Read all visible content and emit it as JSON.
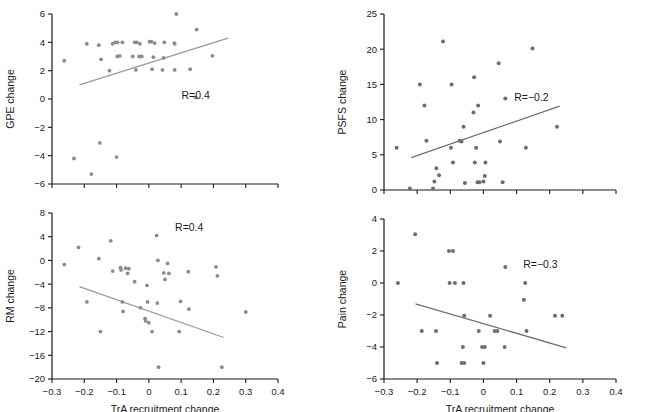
{
  "figure": {
    "xlabel": "TrA recruitment change",
    "panels": [
      "gpe",
      "psfs",
      "rm",
      "pain"
    ]
  },
  "chart_data": [
    {
      "id": "gpe",
      "type": "scatter",
      "title": "",
      "xlabel": "",
      "ylabel": "GPE change",
      "xlim": [
        -0.3,
        0.4
      ],
      "ylim": [
        -6,
        6
      ],
      "xticks": [
        -0.3,
        -0.2,
        -0.1,
        0,
        0.1,
        0.2,
        0.3,
        0.4
      ],
      "xticklabels": [
        "−0.3",
        "−0.2",
        "−0.1",
        "0",
        "0.1",
        "0.2",
        "0.3",
        "0.4"
      ],
      "yticks": [
        -6,
        -4,
        -2,
        0,
        2,
        4,
        6
      ],
      "yticklabels": [
        "−6",
        "−4",
        "−2",
        "0",
        "2",
        "4",
        "6"
      ],
      "grid": false,
      "legend": null,
      "annotation": "R=0.4",
      "annotation_xy": [
        0.145,
        0.0
      ],
      "marker_color": "#8c8c8c",
      "line_color": "#9a9a9a",
      "trendline": {
        "x": [
          -0.215,
          0.245
        ],
        "y": [
          1.0,
          4.3
        ]
      },
      "points": [
        {
          "x": -0.262,
          "y": 2.7
        },
        {
          "x": -0.232,
          "y": -4.2
        },
        {
          "x": -0.192,
          "y": 3.9
        },
        {
          "x": -0.178,
          "y": -5.3
        },
        {
          "x": -0.155,
          "y": 3.8
        },
        {
          "x": -0.148,
          "y": 2.8
        },
        {
          "x": -0.152,
          "y": -3.1
        },
        {
          "x": -0.122,
          "y": 2.0
        },
        {
          "x": -0.112,
          "y": 3.9
        },
        {
          "x": -0.104,
          "y": 4.0
        },
        {
          "x": -0.097,
          "y": 4.0
        },
        {
          "x": -0.098,
          "y": 3.0
        },
        {
          "x": -0.09,
          "y": 3.05
        },
        {
          "x": -0.082,
          "y": 4.0
        },
        {
          "x": -0.1,
          "y": -4.1
        },
        {
          "x": -0.05,
          "y": 3.0
        },
        {
          "x": -0.044,
          "y": 4.0
        },
        {
          "x": -0.038,
          "y": 4.0
        },
        {
          "x": -0.028,
          "y": 3.9
        },
        {
          "x": -0.03,
          "y": 3.0
        },
        {
          "x": -0.022,
          "y": 3.0
        },
        {
          "x": -0.04,
          "y": 2.05
        },
        {
          "x": 0.002,
          "y": 4.05
        },
        {
          "x": 0.008,
          "y": 4.05
        },
        {
          "x": 0.018,
          "y": 3.95
        },
        {
          "x": 0.014,
          "y": 2.95
        },
        {
          "x": 0.01,
          "y": 2.1
        },
        {
          "x": 0.048,
          "y": 4.0
        },
        {
          "x": 0.046,
          "y": 2.9
        },
        {
          "x": 0.042,
          "y": 2.05
        },
        {
          "x": 0.079,
          "y": 3.95
        },
        {
          "x": 0.08,
          "y": 3.9
        },
        {
          "x": 0.085,
          "y": 6.0
        },
        {
          "x": 0.08,
          "y": 2.05
        },
        {
          "x": 0.128,
          "y": 2.1
        },
        {
          "x": 0.148,
          "y": 4.9
        },
        {
          "x": 0.197,
          "y": 3.05
        },
        {
          "x": 0.145,
          "y": 0.1
        }
      ]
    },
    {
      "id": "psfs",
      "type": "scatter",
      "title": "",
      "xlabel": "",
      "ylabel": "PSFS change",
      "xlim": [
        -0.3,
        0.4
      ],
      "ylim": [
        0,
        25
      ],
      "xticks": [
        -0.3,
        -0.2,
        -0.1,
        0,
        0.1,
        0.2,
        0.3,
        0.4
      ],
      "xticklabels": [
        "−0.3",
        "−0.2",
        "−0.1",
        "0",
        "0.1",
        "0.2",
        "0.3",
        "0.4"
      ],
      "yticks": [
        0,
        5,
        10,
        15,
        20,
        25
      ],
      "yticklabels": [
        "0",
        "5",
        "10",
        "15",
        "20",
        "25"
      ],
      "grid": false,
      "legend": null,
      "annotation": "R=−0.2",
      "annotation_xy": [
        0.145,
        12.6
      ],
      "marker_color": "#6e6e6e",
      "line_color": "#6e6e6e",
      "trendline": {
        "x": [
          -0.218,
          0.23
        ],
        "y": [
          4.6,
          11.9
        ]
      },
      "points": [
        {
          "x": -0.262,
          "y": 6.0
        },
        {
          "x": -0.222,
          "y": 0.2
        },
        {
          "x": -0.192,
          "y": 15.0
        },
        {
          "x": -0.178,
          "y": 12.0
        },
        {
          "x": -0.172,
          "y": 7.0
        },
        {
          "x": -0.152,
          "y": 0.2
        },
        {
          "x": -0.148,
          "y": 1.2
        },
        {
          "x": -0.142,
          "y": 3.1
        },
        {
          "x": -0.134,
          "y": 2.1
        },
        {
          "x": -0.122,
          "y": 21.1
        },
        {
          "x": -0.098,
          "y": 6.0
        },
        {
          "x": -0.096,
          "y": 15.0
        },
        {
          "x": -0.092,
          "y": 3.9
        },
        {
          "x": -0.072,
          "y": 7.0
        },
        {
          "x": -0.066,
          "y": 6.9
        },
        {
          "x": -0.06,
          "y": 9.0
        },
        {
          "x": -0.056,
          "y": 1.0
        },
        {
          "x": -0.028,
          "y": 16.0
        },
        {
          "x": -0.03,
          "y": 11.0
        },
        {
          "x": -0.022,
          "y": 6.0
        },
        {
          "x": -0.026,
          "y": 3.9
        },
        {
          "x": -0.018,
          "y": 1.1
        },
        {
          "x": -0.012,
          "y": 1.1
        },
        {
          "x": -0.016,
          "y": 12.0
        },
        {
          "x": 0.006,
          "y": 3.9
        },
        {
          "x": 0.004,
          "y": 2.0
        },
        {
          "x": 0.0,
          "y": 1.2
        },
        {
          "x": 0.046,
          "y": 18.0
        },
        {
          "x": 0.05,
          "y": 6.9
        },
        {
          "x": 0.058,
          "y": 1.1
        },
        {
          "x": 0.066,
          "y": 13.0
        },
        {
          "x": 0.148,
          "y": 20.1
        },
        {
          "x": 0.128,
          "y": 6.0
        },
        {
          "x": 0.222,
          "y": 9.0
        }
      ]
    },
    {
      "id": "rm",
      "type": "scatter",
      "title": "",
      "xlabel": "TrA recruitment change",
      "ylabel": "RM change",
      "xlim": [
        -0.3,
        0.4
      ],
      "ylim": [
        -20,
        8
      ],
      "xticks": [
        -0.3,
        -0.2,
        -0.1,
        0,
        0.1,
        0.2,
        0.3,
        0.4
      ],
      "xticklabels": [
        "−0.3",
        "−0.2",
        "−0.1",
        "0",
        "0.1",
        "0.2",
        "0.3",
        "0.4"
      ],
      "yticks": [
        -20,
        -16,
        -12,
        -8,
        -4,
        0,
        4,
        8
      ],
      "yticklabels": [
        "−20",
        "−16",
        "−12",
        "−8",
        "−4",
        "0",
        "4",
        "8"
      ],
      "grid": false,
      "legend": null,
      "annotation": "R=0.4",
      "annotation_xy": [
        0.125,
        5.0
      ],
      "marker_color": "#9a9a9a",
      "line_color": "#b0b0b0",
      "trendline": {
        "x": [
          -0.215,
          0.232
        ],
        "y": [
          -4.4,
          -13.0
        ]
      },
      "points": [
        {
          "x": -0.262,
          "y": -0.7
        },
        {
          "x": -0.218,
          "y": 2.2
        },
        {
          "x": -0.192,
          "y": -7.0
        },
        {
          "x": -0.155,
          "y": 0.3
        },
        {
          "x": -0.15,
          "y": -12.0
        },
        {
          "x": -0.118,
          "y": 3.3
        },
        {
          "x": -0.112,
          "y": -1.8
        },
        {
          "x": -0.088,
          "y": -1.2
        },
        {
          "x": -0.086,
          "y": -1.6
        },
        {
          "x": -0.082,
          "y": -7.0
        },
        {
          "x": -0.08,
          "y": -8.6
        },
        {
          "x": -0.072,
          "y": -1.3
        },
        {
          "x": -0.066,
          "y": -2.2
        },
        {
          "x": -0.062,
          "y": -1.4
        },
        {
          "x": -0.044,
          "y": -3.6
        },
        {
          "x": -0.026,
          "y": -8.0
        },
        {
          "x": -0.012,
          "y": -9.8
        },
        {
          "x": -0.01,
          "y": -10.2
        },
        {
          "x": -0.006,
          "y": -4.2
        },
        {
          "x": -0.004,
          "y": -7.0
        },
        {
          "x": 0.0,
          "y": -10.5
        },
        {
          "x": 0.01,
          "y": -12.0
        },
        {
          "x": 0.024,
          "y": 4.2
        },
        {
          "x": 0.028,
          "y": 0.0
        },
        {
          "x": 0.026,
          "y": -7.2
        },
        {
          "x": 0.03,
          "y": -18.0
        },
        {
          "x": 0.046,
          "y": -2.1
        },
        {
          "x": 0.05,
          "y": -3.2
        },
        {
          "x": 0.058,
          "y": -0.5
        },
        {
          "x": 0.062,
          "y": -2.2
        },
        {
          "x": 0.094,
          "y": -12.0
        },
        {
          "x": 0.098,
          "y": -6.9
        },
        {
          "x": 0.122,
          "y": -1.9
        },
        {
          "x": 0.124,
          "y": -8.2
        },
        {
          "x": 0.208,
          "y": -1.1
        },
        {
          "x": 0.212,
          "y": -2.6
        },
        {
          "x": 0.226,
          "y": -18.0
        },
        {
          "x": 0.3,
          "y": -8.7
        }
      ]
    },
    {
      "id": "pain",
      "type": "scatter",
      "title": "",
      "xlabel": "TrA recruitment change",
      "ylabel": "Pain change",
      "xlim": [
        -0.3,
        0.4
      ],
      "ylim": [
        -6,
        4
      ],
      "xticks": [
        -0.3,
        -0.2,
        -0.1,
        0,
        0.1,
        0.2,
        0.3,
        0.4
      ],
      "xticklabels": [
        "−0.3",
        "−0.2",
        "−0.1",
        "0",
        "0.1",
        "0.2",
        "0.3",
        "0.4"
      ],
      "yticks": [
        -6,
        -4,
        -2,
        0,
        2,
        4
      ],
      "yticklabels": [
        "−6",
        "−4",
        "−2",
        "0",
        "2",
        "4"
      ],
      "grid": false,
      "legend": null,
      "annotation": "R=−0.3",
      "annotation_xy": [
        0.172,
        0.95
      ],
      "marker_color": "#6e6e6e",
      "line_color": "#6e6e6e",
      "trendline": {
        "x": [
          -0.205,
          0.25
        ],
        "y": [
          -1.3,
          -4.05
        ]
      },
      "points": [
        {
          "x": -0.258,
          "y": 0.0
        },
        {
          "x": -0.206,
          "y": 3.05
        },
        {
          "x": -0.186,
          "y": -3.0
        },
        {
          "x": -0.143,
          "y": -3.0
        },
        {
          "x": -0.14,
          "y": -5.0
        },
        {
          "x": -0.104,
          "y": 2.0
        },
        {
          "x": -0.092,
          "y": 2.0
        },
        {
          "x": -0.102,
          "y": 0.0
        },
        {
          "x": -0.086,
          "y": 0.0
        },
        {
          "x": -0.06,
          "y": 0.0
        },
        {
          "x": -0.058,
          "y": -2.05
        },
        {
          "x": -0.062,
          "y": -4.0
        },
        {
          "x": -0.066,
          "y": -5.0
        },
        {
          "x": -0.058,
          "y": -5.0
        },
        {
          "x": -0.014,
          "y": -3.0
        },
        {
          "x": -0.004,
          "y": -4.0
        },
        {
          "x": 0.004,
          "y": -4.0
        },
        {
          "x": 0.0,
          "y": -5.0
        },
        {
          "x": 0.02,
          "y": -2.05
        },
        {
          "x": 0.034,
          "y": -3.0
        },
        {
          "x": 0.042,
          "y": -3.0
        },
        {
          "x": 0.066,
          "y": 1.0
        },
        {
          "x": 0.064,
          "y": -4.0
        },
        {
          "x": 0.126,
          "y": 0.0
        },
        {
          "x": 0.122,
          "y": -1.05
        },
        {
          "x": 0.13,
          "y": -3.0
        },
        {
          "x": 0.216,
          "y": -2.05
        },
        {
          "x": 0.238,
          "y": -2.05
        }
      ]
    }
  ]
}
